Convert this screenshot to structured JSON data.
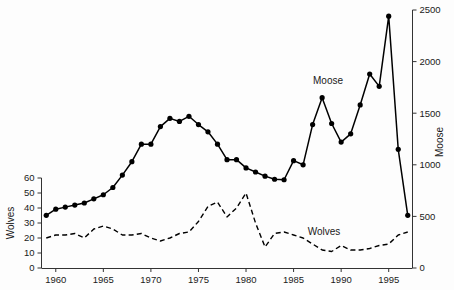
{
  "chart_data": {
    "type": "line",
    "title": "",
    "xlabel": "",
    "grid": false,
    "legend_position": "inline-annotation",
    "x": [
      1959,
      1960,
      1961,
      1962,
      1963,
      1964,
      1965,
      1966,
      1967,
      1968,
      1969,
      1970,
      1971,
      1972,
      1973,
      1974,
      1975,
      1976,
      1977,
      1978,
      1979,
      1980,
      1981,
      1982,
      1983,
      1984,
      1985,
      1986,
      1987,
      1988,
      1989,
      1990,
      1991,
      1992,
      1993,
      1994,
      1995,
      1996,
      1997
    ],
    "xlim": [
      1958.5,
      1997.5
    ],
    "xticks": [
      1960,
      1965,
      1970,
      1975,
      1980,
      1985,
      1990,
      1995
    ],
    "xticklabels": [
      "1960",
      "1965",
      "1970",
      "1975",
      "1980",
      "1985",
      "1990",
      "1995"
    ],
    "left_axis": {
      "label": "Wolves",
      "lim": [
        0,
        60
      ],
      "ticks": [
        0,
        10,
        20,
        30,
        40,
        50,
        60
      ],
      "ticklabels": [
        "0",
        "10",
        "20",
        "30",
        "40",
        "50",
        "60"
      ]
    },
    "right_axis": {
      "label": "Moose",
      "lim": [
        0,
        2500
      ],
      "ticks": [
        0,
        500,
        1000,
        1500,
        2000,
        2500
      ],
      "ticklabels": [
        "0",
        "500",
        "1000",
        "1500",
        "2000",
        "2500"
      ]
    },
    "series": [
      {
        "name": "Moose",
        "axis": "right",
        "style": "solid",
        "marker": "filled-circle",
        "annotation": "Moose",
        "values": [
          510,
          570,
          590,
          610,
          630,
          670,
          710,
          780,
          900,
          1030,
          1200,
          1200,
          1370,
          1450,
          1420,
          1470,
          1390,
          1320,
          1200,
          1050,
          1050,
          970,
          930,
          890,
          860,
          855,
          1040,
          1000,
          1390,
          1650,
          1400,
          1220,
          1300,
          1580,
          1880,
          1760,
          2440,
          1150,
          510
        ]
      },
      {
        "name": "Wolves",
        "axis": "left",
        "style": "dashed",
        "marker": "none",
        "annotation": "Wolves",
        "values": [
          20,
          22,
          22,
          23,
          20,
          26,
          28,
          26,
          22,
          22,
          23,
          20,
          18,
          20,
          23,
          24,
          31,
          41,
          44,
          34,
          40,
          50,
          30,
          14,
          23,
          24,
          22,
          20,
          16,
          12,
          11,
          15,
          12,
          12,
          13,
          15,
          16,
          22,
          24
        ]
      }
    ]
  },
  "annotations": {
    "moose_label": "Moose",
    "wolves_label": "Wolves"
  },
  "colors": {
    "line": "#000000",
    "axis": "#333333",
    "text": "#1a1a1a",
    "background": "#fdfdfd"
  }
}
